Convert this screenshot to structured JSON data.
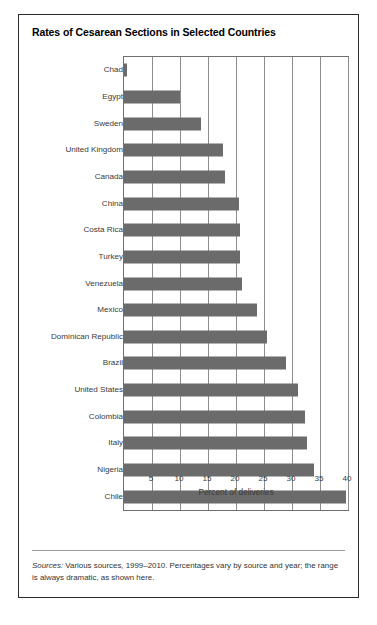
{
  "figure": {
    "title": "Rates of Cesarean Sections in Selected Countries",
    "source_lead": "Sources:",
    "source_text": " Various sources, 1999–2010. Percentages vary by source and year; the range is always dramatic, as shown here."
  },
  "colors": {
    "bar": "#6b6b6b",
    "grid": "#8d8d8d",
    "frame": "#2a2a2a",
    "text": "#333333",
    "background": "#ffffff"
  },
  "chart_data": {
    "type": "bar",
    "orientation": "horizontal",
    "title": "Rates of Cesarean Sections in Selected Countries",
    "xlabel": "Percent of deliveries",
    "ylabel": "",
    "xlim": [
      0,
      40
    ],
    "xticks": [
      5,
      10,
      15,
      20,
      25,
      30,
      35,
      40
    ],
    "xticklabels": [
      "5",
      "10",
      "15",
      "20",
      "25",
      "30",
      "35",
      "40"
    ],
    "grid": true,
    "grid_axis": "x",
    "legend": false,
    "categories": [
      "Chad",
      "Egypt",
      "Sweden",
      "United Kingdom",
      "Canada",
      "China",
      "Costa Rica",
      "Turkey",
      "Venezuela",
      "Mexico",
      "Dominican Republic",
      "Brazil",
      "United States",
      "Colombia",
      "Italy",
      "Nigeria",
      "Chile"
    ],
    "values": [
      0.5,
      10.0,
      13.8,
      17.6,
      18.0,
      20.6,
      20.8,
      20.8,
      21.0,
      23.8,
      25.6,
      29.0,
      31.0,
      32.3,
      32.6,
      34.0,
      39.7
    ],
    "units": "percent of deliveries",
    "annotation": "Sources: Various sources, 1999–2010. Percentages vary by source and year; the range is always dramatic, as shown here."
  }
}
